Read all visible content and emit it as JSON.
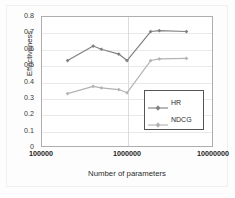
{
  "chart_data": {
    "type": "line",
    "title": "",
    "xlabel": "Number of parameters",
    "ylabel": "Effectiveness",
    "xscale": "log",
    "xlim": [
      100000,
      10000000
    ],
    "ylim": [
      0,
      0.8
    ],
    "grid": true,
    "legend_position": "center-right-inside",
    "x_tick_labels": [
      "100000",
      "1000000",
      "10000000"
    ],
    "x_tick_values": [
      100000,
      1000000,
      10000000
    ],
    "y_tick_labels": [
      "0",
      "0.1",
      "0.2",
      "0.3",
      "0.4",
      "0.5",
      "0.6",
      "0.7",
      "0.8"
    ],
    "y_tick_values": [
      0,
      0.1,
      0.2,
      0.3,
      0.4,
      0.5,
      0.6,
      0.7,
      0.8
    ],
    "x": [
      200000,
      400000,
      500000,
      800000,
      1000000,
      1900000,
      2400000,
      5000000
    ],
    "series": [
      {
        "name": "HR",
        "color": "#808080",
        "marker": "diamond",
        "values": [
          0.53,
          0.62,
          0.6,
          0.57,
          0.53,
          0.71,
          0.715,
          0.71
        ]
      },
      {
        "name": "NDCG",
        "color": "#b3b3b3",
        "marker": "diamond",
        "values": [
          0.325,
          0.37,
          0.36,
          0.35,
          0.33,
          0.53,
          0.54,
          0.543
        ]
      }
    ]
  },
  "legend": {
    "items": [
      {
        "label": "HR"
      },
      {
        "label": "NDCG"
      }
    ]
  },
  "axes": {
    "y_title": "Effectiveness",
    "x_title": "Number of parameters"
  },
  "colors": {
    "series_hr": "#808080",
    "series_ndcg": "#b3b3b3",
    "axis": "#aeaeae",
    "grid": "#e9e9e9",
    "text": "#2b2b2b",
    "background": "#ffffff"
  }
}
